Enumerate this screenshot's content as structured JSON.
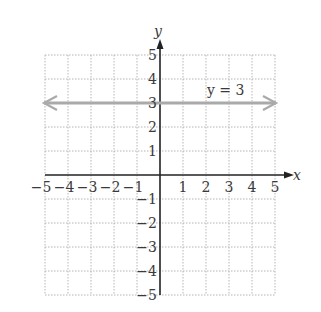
{
  "chart_data": {
    "type": "line",
    "title": "",
    "xlabel": "x",
    "ylabel": "y",
    "xlim": [
      -5,
      5
    ],
    "ylim": [
      -5,
      5
    ],
    "grid": true,
    "x_ticks": [
      "-5",
      "-4",
      "-3",
      "-2",
      "-1",
      "1",
      "2",
      "3",
      "4",
      "5"
    ],
    "y_ticks": [
      "5",
      "4",
      "3",
      "2",
      "1",
      "-1",
      "-2",
      "-3",
      "-4",
      "-5"
    ],
    "series": [
      {
        "name": "y = 3",
        "equation": "y = 3",
        "x": [
          -5,
          5
        ],
        "y": [
          3,
          3
        ],
        "color": "#aaaaaa",
        "arrows_both_ends": true
      }
    ],
    "annotations": [
      {
        "text": "y = 3",
        "x": 3,
        "y": 3.6
      }
    ]
  },
  "labels": {
    "x_axis": "x",
    "y_axis": "y",
    "line_label": "y = 3"
  },
  "colors": {
    "line": "#aaaaaa",
    "axis": "#222222",
    "grid": "#b5b5b5"
  }
}
